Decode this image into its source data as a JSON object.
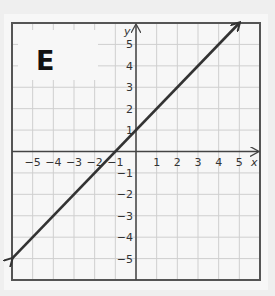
{
  "panel_label": "E",
  "axes": {
    "x_label": "x",
    "y_label": "y",
    "x_min": -6,
    "x_max": 6,
    "y_min": -6,
    "y_max": 6,
    "x_ticks": [
      "-5",
      "-4",
      "-3",
      "-2",
      "-1",
      "1",
      "2",
      "3",
      "4",
      "5"
    ],
    "y_ticks": [
      "5",
      "4",
      "3",
      "2",
      "1",
      "-1",
      "-2",
      "-3",
      "-4",
      "-5"
    ]
  },
  "line": {
    "equation": "y = x + 1",
    "start": [
      -6,
      -5
    ],
    "end": [
      5,
      6
    ],
    "arrows": "both",
    "color": "#333333"
  },
  "colors": {
    "grid": "#cfcfcf",
    "frame": "#555555",
    "axis": "#444444",
    "background": "#f7f7f7"
  }
}
